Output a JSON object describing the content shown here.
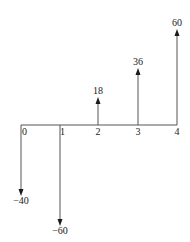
{
  "diagram": {
    "type": "cash-flow-diagram",
    "axis": {
      "y": 125,
      "x_start": 21,
      "x_end": 177,
      "color": "#555555"
    },
    "periods": [
      {
        "label": "0",
        "x": 21
      },
      {
        "label": "1",
        "x": 60
      },
      {
        "label": "2",
        "x": 98
      },
      {
        "label": "3",
        "x": 138
      },
      {
        "label": "4",
        "x": 177
      }
    ],
    "flows": [
      {
        "period": "0",
        "value": -40,
        "label": "−40",
        "x": 21,
        "tip_y": 196,
        "label_y": 204
      },
      {
        "period": "1",
        "value": -60,
        "label": "−60",
        "x": 60,
        "tip_y": 226,
        "label_y": 234
      },
      {
        "period": "2",
        "value": 18,
        "label": "18",
        "x": 98,
        "tip_y": 97,
        "label_y": 94
      },
      {
        "period": "3",
        "value": 36,
        "label": "36",
        "x": 138,
        "tip_y": 68,
        "label_y": 65
      },
      {
        "period": "4",
        "value": 60,
        "label": "60",
        "x": 177,
        "tip_y": 29,
        "label_y": 26
      }
    ]
  }
}
